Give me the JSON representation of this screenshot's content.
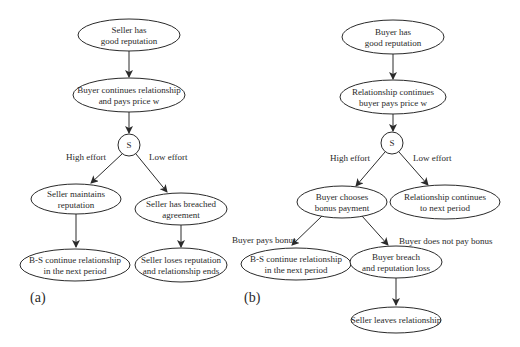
{
  "figure": {
    "panels": [
      {
        "label": "(a)",
        "nodes": {
          "seller_good_rep": {
            "line1": "Seller has",
            "line2": "good reputation"
          },
          "buyer_continues": {
            "line1": "Buyer continues relationship",
            "line2": "and pays price w"
          },
          "s_node": {
            "label": "S"
          },
          "seller_maintains": {
            "line1": "Seller maintains",
            "line2": "reputation"
          },
          "seller_breached": {
            "line1": "Seller has breached",
            "line2": "agreement"
          },
          "bs_continue": {
            "line1": "B-S continue relationship",
            "line2": "in the next period"
          },
          "seller_loses": {
            "line1": "Seller loses reputation",
            "line2": "and relationship ends"
          }
        },
        "edge_labels": {
          "high": "High effort",
          "low": "Low effort"
        }
      },
      {
        "label": "(b)",
        "nodes": {
          "buyer_good_rep": {
            "line1": "Buyer has",
            "line2": "good reputation"
          },
          "relationship_continues": {
            "line1": "Relationship continues",
            "line2": "buyer pays price w"
          },
          "s_node": {
            "label": "S"
          },
          "buyer_chooses": {
            "line1": "Buyer chooses",
            "line2": "bonus payment"
          },
          "rel_next_period": {
            "line1": "Relationship continues",
            "line2": "to next period"
          },
          "bs_continue": {
            "line1": "B-S continue relationship",
            "line2": "in the next period"
          },
          "buyer_breach": {
            "line1": "Buyer breach",
            "line2": "and reputation loss"
          },
          "seller_leaves": {
            "line1": "Seller leaves relationship"
          }
        },
        "edge_labels": {
          "high": "High effort",
          "low": "Low effort",
          "pays": "Buyer pays bonus",
          "not_pays": "Buyer does not pay bonus"
        }
      }
    ]
  }
}
